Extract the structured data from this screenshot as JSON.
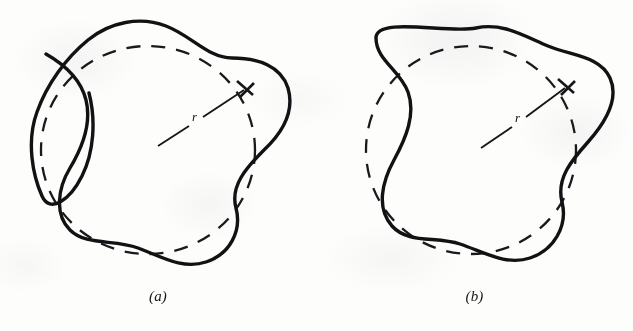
{
  "figure": {
    "background_color": "#fdfdfc",
    "ink_color": "#121214",
    "panels": [
      {
        "id": "a",
        "caption": "(a)",
        "radius_label": "r",
        "reference_circle": {
          "style": "dashed",
          "center_x": 148,
          "center_y": 150,
          "radius_x": 107,
          "radius_y": 104,
          "dash_pattern": "14 11"
        },
        "radius_arrow": {
          "from_x": 158,
          "from_y": 146,
          "to_x": 247,
          "to_y": 88,
          "label": "r",
          "label_x": 196,
          "label_y": 117
        },
        "wavy_curve": {
          "style": "solid",
          "lobes": 5,
          "closed": false,
          "has_self_intersection": true,
          "has_free_endpoint": true,
          "free_endpoint_x": 89,
          "free_endpoint_y": 93,
          "description": "irregular lobed curve that overshoots and crosses itself on the left side"
        }
      },
      {
        "id": "b",
        "caption": "(b)",
        "radius_label": "r",
        "reference_circle": {
          "style": "dashed",
          "center_x": 155,
          "center_y": 150,
          "radius_x": 105,
          "radius_y": 104,
          "dash_pattern": "14 11"
        },
        "radius_arrow": {
          "from_x": 165,
          "from_y": 148,
          "to_x": 252,
          "to_y": 86,
          "label": "r",
          "label_x": 203,
          "label_y": 118
        },
        "wavy_curve": {
          "style": "solid",
          "lobes": 5,
          "closed": true,
          "has_self_intersection": false,
          "has_free_endpoint": false,
          "description": "smooth closed five-lobed curve enclosing the dashed reference circle"
        }
      }
    ]
  }
}
